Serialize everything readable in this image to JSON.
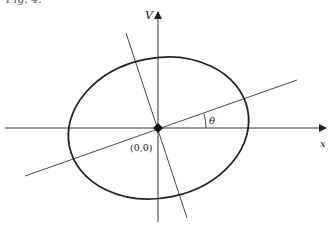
{
  "caption": "Fig. 4.",
  "diagram": {
    "type": "rotated ellipse with principal axes",
    "axes": {
      "horizontal_label": "x",
      "vertical_label": "V"
    },
    "origin_label": "(0,0)",
    "angle_label": "θ",
    "colors": {
      "stroke": "#222222",
      "background": "#ffffff"
    }
  }
}
